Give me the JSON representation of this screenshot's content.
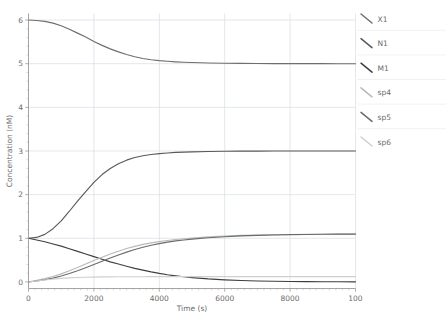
{
  "chart_data": {
    "type": "line",
    "title": "",
    "xlabel": "Time (s)",
    "ylabel": "Concentration (nM)",
    "xlim": [
      0,
      10000
    ],
    "ylim": [
      -0.15,
      6.15
    ],
    "xticks": [
      0,
      2000,
      4000,
      6000,
      8000,
      10000
    ],
    "xticklabels": [
      "0",
      "2000",
      "4000",
      "6000",
      "8000",
      "100"
    ],
    "yticks": [
      0,
      1,
      2,
      3,
      4,
      5,
      6
    ],
    "yticklabels": [
      "0",
      "1",
      "2",
      "3",
      "4",
      "5",
      "6"
    ],
    "grid": true,
    "legend_position": "right",
    "x": [
      0,
      250,
      500,
      750,
      1000,
      1250,
      1500,
      1750,
      2000,
      2250,
      2500,
      2750,
      3000,
      3250,
      3500,
      3750,
      4000,
      4250,
      4500,
      4750,
      5000,
      5500,
      6000,
      6500,
      7000,
      7500,
      8000,
      8500,
      9000,
      9500,
      10000
    ],
    "series": [
      {
        "name": "X1",
        "color": "#6e6e6e",
        "values": [
          6.0,
          5.99,
          5.97,
          5.93,
          5.87,
          5.79,
          5.7,
          5.61,
          5.51,
          5.42,
          5.34,
          5.27,
          5.21,
          5.16,
          5.12,
          5.09,
          5.07,
          5.055,
          5.043,
          5.034,
          5.027,
          5.017,
          5.011,
          5.007,
          5.004,
          5.003,
          5.002,
          5.001,
          5.001,
          5.0,
          5.0
        ]
      },
      {
        "name": "N1",
        "color": "#5a5a5a",
        "values": [
          1.0,
          1.02,
          1.09,
          1.22,
          1.4,
          1.62,
          1.85,
          2.07,
          2.28,
          2.46,
          2.6,
          2.71,
          2.79,
          2.85,
          2.89,
          2.92,
          2.94,
          2.955,
          2.967,
          2.975,
          2.981,
          2.989,
          2.994,
          2.996,
          2.998,
          2.999,
          2.999,
          3.0,
          3.0,
          3.0,
          3.0
        ]
      },
      {
        "name": "M1",
        "color": "#3f3f3f",
        "values": [
          1.0,
          0.96,
          0.92,
          0.87,
          0.82,
          0.76,
          0.7,
          0.64,
          0.58,
          0.52,
          0.46,
          0.41,
          0.36,
          0.31,
          0.27,
          0.23,
          0.195,
          0.165,
          0.14,
          0.118,
          0.099,
          0.069,
          0.048,
          0.033,
          0.023,
          0.016,
          0.011,
          0.008,
          0.005,
          0.004,
          0.003
        ]
      },
      {
        "name": "sp4",
        "color": "#b9b9b9",
        "values": [
          0.0,
          0.035,
          0.075,
          0.125,
          0.185,
          0.255,
          0.33,
          0.41,
          0.49,
          0.565,
          0.64,
          0.705,
          0.765,
          0.815,
          0.86,
          0.895,
          0.925,
          0.95,
          0.972,
          0.99,
          1.005,
          1.032,
          1.052,
          1.066,
          1.076,
          1.083,
          1.088,
          1.092,
          1.094,
          1.096,
          1.098
        ]
      },
      {
        "name": "sp5",
        "color": "#6b6b6b",
        "values": [
          0.0,
          0.022,
          0.05,
          0.088,
          0.135,
          0.192,
          0.256,
          0.326,
          0.4,
          0.474,
          0.548,
          0.618,
          0.683,
          0.742,
          0.794,
          0.84,
          0.879,
          0.912,
          0.94,
          0.962,
          0.981,
          1.012,
          1.036,
          1.054,
          1.066,
          1.076,
          1.083,
          1.088,
          1.092,
          1.095,
          1.097
        ]
      },
      {
        "name": "sp6",
        "color": "#cfcfcf",
        "values": [
          0.0,
          0.022,
          0.045,
          0.065,
          0.082,
          0.094,
          0.102,
          0.108,
          0.112,
          0.115,
          0.117,
          0.118,
          0.119,
          0.12,
          0.12,
          0.121,
          0.121,
          0.121,
          0.121,
          0.122,
          0.122,
          0.122,
          0.122,
          0.122,
          0.122,
          0.122,
          0.122,
          0.122,
          0.122,
          0.122,
          0.122
        ]
      }
    ]
  },
  "legend": {
    "entries": [
      {
        "label": "X1",
        "color": "#6e6e6e"
      },
      {
        "label": "N1",
        "color": "#5a5a5a"
      },
      {
        "label": "M1",
        "color": "#3f3f3f"
      },
      {
        "label": "sp4",
        "color": "#b9b9b9"
      },
      {
        "label": "sp5",
        "color": "#6b6b6b"
      },
      {
        "label": "sp6",
        "color": "#cfcfcf"
      }
    ]
  }
}
